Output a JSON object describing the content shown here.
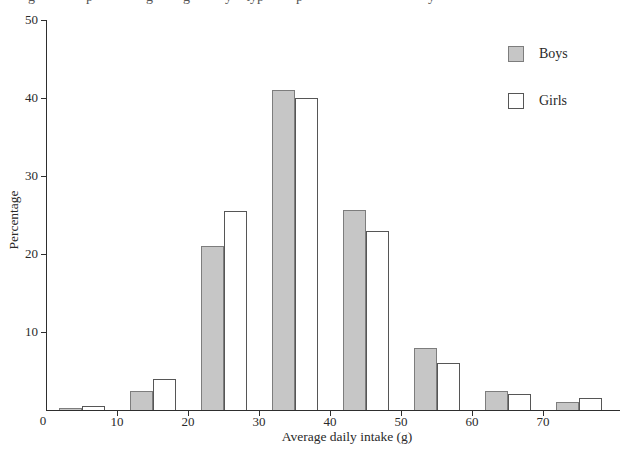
{
  "page": {
    "background": "#ffffff",
    "cropped_caption_fragments": [
      {
        "x": 28,
        "glyph": "g"
      },
      {
        "x": 86,
        "glyph": "p"
      },
      {
        "x": 146,
        "glyph": "g"
      },
      {
        "x": 183,
        "glyph": "g"
      },
      {
        "x": 225,
        "glyph": "y"
      },
      {
        "x": 246,
        "glyph": "typ"
      },
      {
        "x": 296,
        "glyph": "p"
      },
      {
        "x": 428,
        "glyph": "y"
      }
    ]
  },
  "chart_data": {
    "type": "bar",
    "title": "",
    "categories": [
      "0-10",
      "10-20",
      "20-30",
      "30-40",
      "40-50",
      "50-60",
      "60-70",
      "70-80"
    ],
    "bin_midpoints": [
      5,
      15,
      25,
      35,
      45,
      55,
      65,
      75
    ],
    "series": [
      {
        "name": "Boys",
        "values": [
          0.3,
          2.5,
          21,
          41,
          25.7,
          8,
          2.5,
          1
        ],
        "fill": "#c6c6c6",
        "border": "#7d7d7d"
      },
      {
        "name": "Girls",
        "values": [
          0.5,
          4,
          25.5,
          40,
          23,
          6,
          2,
          1.5
        ],
        "fill": "#ffffff",
        "border": "#565656"
      }
    ],
    "xlabel": "Average daily intake (g)",
    "ylabel": "Percentage",
    "x_ticks": [
      10,
      20,
      30,
      40,
      50,
      60,
      70
    ],
    "y_ticks": [
      0,
      10,
      20,
      30,
      40,
      50
    ],
    "origin_label": "0",
    "ylim": [
      0,
      50
    ],
    "xlim": [
      0,
      81
    ],
    "grid": false,
    "legend_position": "upper-right",
    "axis_color": "#2e2e2e",
    "text_color": "#2a2a2a"
  }
}
